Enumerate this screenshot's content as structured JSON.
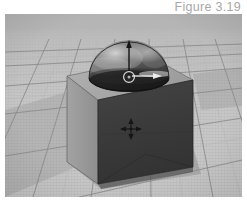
{
  "figure": {
    "caption": "Figure 3.19",
    "caption_color": "#a8a8a8"
  },
  "viewport": {
    "name": "3d-viewport",
    "background_color": "#b9b9b9",
    "grid": {
      "floor_color": "#c3c3c3",
      "major_line_color": "#8c8c8c",
      "minor_line_color": "#b4b4b4",
      "shadow_color": "#a0a0a0",
      "horizon_band_color": "#bdbdbd"
    }
  },
  "objects": {
    "cube": {
      "label": "cube",
      "top_face_color": "#a9a9a9",
      "left_face_color": "#9a9a9a",
      "front_face_color": "#3a3a3a",
      "edge_color": "#2e2e2e"
    },
    "dome": {
      "label": "hemisphere-dome",
      "body_color": "#5a5a5a",
      "highlight_color": "#d6d6d6",
      "shadow_color": "#1e1e1e",
      "rim_color": "#141414"
    }
  },
  "manipulators": {
    "translate_y_handle": {
      "label": "y-axis-translate-handle",
      "color": "#141414"
    },
    "translate_x_handle": {
      "label": "x-axis-translate-handle",
      "color": "#e8e8e8"
    },
    "center_pivot": {
      "label": "center-pivot-circle",
      "color": "#ededed"
    },
    "move_gizmo": {
      "label": "four-arrow-move-gizmo",
      "color": "#1b1b1b"
    }
  }
}
